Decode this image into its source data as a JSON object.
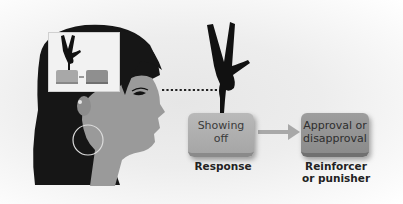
{
  "diagram": {
    "response_box": {
      "text_line1": "Showing",
      "text_line2": "off"
    },
    "reinforcer_box": {
      "text_line1": "Approval or",
      "text_line2": "disapproval"
    },
    "labels": {
      "response": "Response",
      "reinforcer_line1": "Reinforcer",
      "reinforcer_line2": "or punisher"
    },
    "icons": [
      "woman-profile-icon",
      "handstand-figure-icon",
      "thought-bubble-icon",
      "arrow-right-icon",
      "dotted-line-icon"
    ],
    "colors": {
      "hair": "#1a1a1a",
      "skin": "#9a9a9a",
      "response_box": "#b0b0b0",
      "reinforcer_box": "#939393",
      "arrow": "#a8a8a8"
    }
  }
}
